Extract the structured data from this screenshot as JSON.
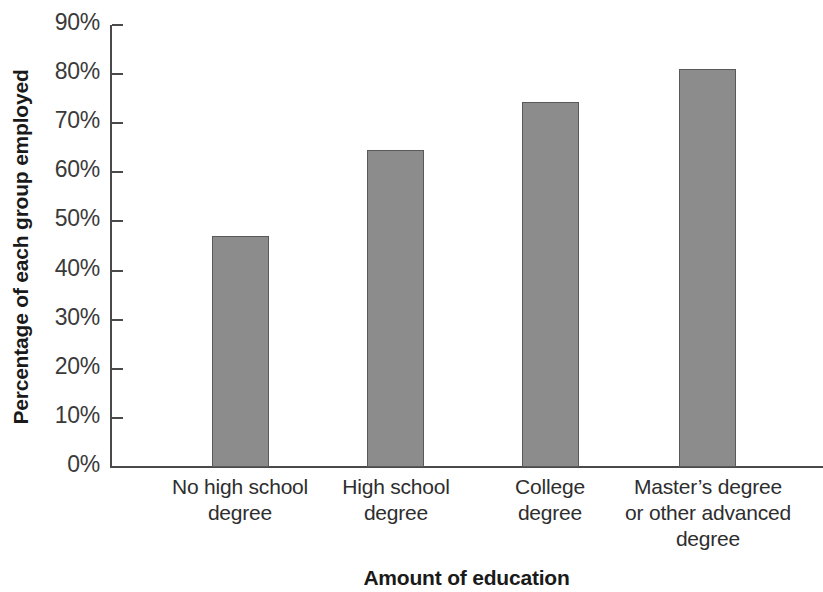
{
  "chart_data": {
    "type": "bar",
    "title": "",
    "subtitle": "",
    "xlabel": "Amount of education",
    "ylabel": "Percentage of each group employed",
    "categories": [
      "No high school degree",
      "High school degree",
      "College degree",
      "Master’s degree or other advanced degree"
    ],
    "category_lines": [
      [
        "No high school",
        "degree"
      ],
      [
        "High school",
        "degree"
      ],
      [
        "College",
        "degree"
      ],
      [
        "Master’s degree",
        "or other advanced",
        "degree"
      ]
    ],
    "values": [
      47,
      64.5,
      74.3,
      81
    ],
    "value_labels": [
      "47%",
      "64.5%",
      "74.3%",
      "81%"
    ],
    "series": [
      {
        "name": "Percentage employed",
        "values": [
          47,
          64.5,
          74.3,
          81
        ]
      }
    ],
    "ylim": [
      0,
      90
    ],
    "ytick_values": [
      0,
      10,
      20,
      30,
      40,
      50,
      60,
      70,
      80,
      90
    ],
    "ytick_labels": [
      "0%",
      "10%",
      "20%",
      "30%",
      "40%",
      "50%",
      "60%",
      "70%",
      "80%",
      "90%"
    ],
    "grid": false,
    "legend": false,
    "legend_position": "none",
    "bar_color": "#8c8c8c",
    "bar_border_color": "#595959",
    "axis_color": "#4a4a4a",
    "background_color": "#ffffff"
  }
}
